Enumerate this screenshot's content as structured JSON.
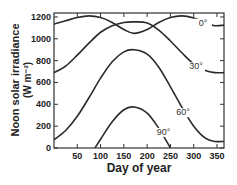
{
  "chart_data": {
    "type": "line",
    "title": "",
    "xlabel": "Day of year",
    "ylabel": "Noon solar irradiance",
    "ylabel_units": "(W m⁻²)",
    "xlim": [
      0,
      365
    ],
    "ylim": [
      0,
      1250
    ],
    "x_ticks": [
      50,
      100,
      150,
      200,
      250,
      300,
      350
    ],
    "y_ticks": [
      0,
      200,
      400,
      600,
      800,
      1000,
      1200
    ],
    "grid": false,
    "legend": "inline curve labels",
    "series": [
      {
        "name": "0°",
        "label": "0°",
        "x": [
          0,
          25,
          50,
          75,
          100,
          125,
          150,
          172,
          200,
          225,
          250,
          275,
          300,
          325,
          345,
          365
        ],
        "y": [
          1135,
          1165,
          1195,
          1210,
          1195,
          1150,
          1085,
          1050,
          1085,
          1150,
          1195,
          1210,
          1190,
          1150,
          1120,
          1125
        ]
      },
      {
        "name": "30°",
        "label": "30°",
        "x": [
          0,
          25,
          50,
          75,
          100,
          125,
          150,
          172,
          200,
          225,
          250,
          275,
          300,
          325,
          345,
          365
        ],
        "y": [
          690,
          750,
          850,
          960,
          1060,
          1120,
          1150,
          1155,
          1145,
          1080,
          980,
          870,
          770,
          710,
          690,
          690
        ]
      },
      {
        "name": "60°",
        "label": "60°",
        "x": [
          0,
          25,
          50,
          75,
          100,
          125,
          150,
          172,
          200,
          225,
          250,
          275,
          300,
          325,
          345,
          365
        ],
        "y": [
          75,
          160,
          290,
          460,
          640,
          790,
          880,
          900,
          860,
          740,
          560,
          370,
          200,
          90,
          60,
          60
        ]
      },
      {
        "name": "90°",
        "label": "90°",
        "x": [
          88,
          100,
          125,
          150,
          172,
          200,
          225,
          250
        ],
        "y": [
          0,
          80,
          240,
          350,
          375,
          320,
          180,
          0
        ]
      }
    ],
    "annotations": [
      {
        "text": "0°",
        "x": 320,
        "y": 1120
      },
      {
        "text": "30°",
        "x": 305,
        "y": 720
      },
      {
        "text": "60°",
        "x": 277,
        "y": 300
      },
      {
        "text": "90°",
        "x": 235,
        "y": 120
      }
    ]
  },
  "colors": {
    "line": "#2a2a2a",
    "axis": "#333333",
    "background": "#ffffff"
  }
}
